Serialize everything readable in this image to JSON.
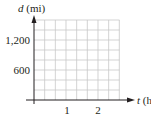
{
  "chart_data": {
    "type": "line",
    "title": "",
    "xlabel": "t (hr)",
    "ylabel": "d (mi)",
    "x_var": "t",
    "x_unit": "(hr)",
    "y_var": "d",
    "y_unit": "(mi)",
    "x_ticks": [
      1,
      2
    ],
    "x_tick_labels": [
      "1",
      "2"
    ],
    "y_ticks": [
      600,
      1200
    ],
    "y_tick_labels": [
      "600",
      "1,200"
    ],
    "xlim": [
      0,
      2.67
    ],
    "ylim": [
      0,
      1600
    ],
    "grid": true,
    "grid_x_step": 0.3333,
    "grid_y_step": 200,
    "series": [],
    "legend": null
  },
  "colors": {
    "axis": "#231f20",
    "grid": "#c8c8c8"
  }
}
